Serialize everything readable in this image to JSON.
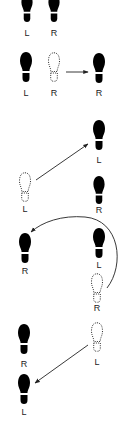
{
  "diagram": {
    "type": "dance-step-footprint-sequence",
    "colors": {
      "solid_foot": "#000000",
      "dotted_foot": "#333333",
      "arrow": "#222222"
    },
    "steps": [
      {
        "name": "step-1-start",
        "feet": [
          {
            "label": "L",
            "style": "solid"
          },
          {
            "label": "R",
            "style": "solid"
          }
        ]
      },
      {
        "name": "step-2",
        "feet": [
          {
            "label": "L",
            "style": "solid"
          },
          {
            "label": "R",
            "style": "dotted"
          },
          {
            "label": "R",
            "style": "solid"
          }
        ],
        "arrow": "straight right"
      },
      {
        "name": "step-3",
        "feet": [
          {
            "label": "L",
            "style": "solid"
          },
          {
            "label": "L",
            "style": "dotted"
          },
          {
            "label": "R",
            "style": "solid"
          }
        ],
        "arrow": "diagonal up-right"
      },
      {
        "name": "step-4",
        "feet": [
          {
            "label": "R",
            "style": "solid"
          },
          {
            "label": "L",
            "style": "solid"
          },
          {
            "label": "R",
            "style": "dotted"
          }
        ],
        "arrow": "curved over to left"
      },
      {
        "name": "step-5",
        "feet": [
          {
            "label": "R",
            "style": "solid"
          },
          {
            "label": "L",
            "style": "dotted"
          },
          {
            "label": "L",
            "style": "solid"
          }
        ],
        "arrow": "diagonal down-left"
      }
    ]
  }
}
